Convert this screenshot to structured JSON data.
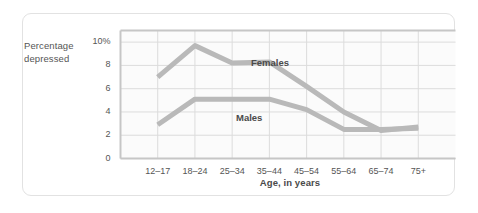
{
  "figure": {
    "y_axis_title_line1": "Percentage",
    "y_axis_title_line2": "depressed",
    "x_axis_title": "Age, in years"
  },
  "colors": {
    "line": "#b9b9b9",
    "grid": "#dcdcdc",
    "axis": "#c6c6c6",
    "text": "#555555",
    "card_border": "#e2e2e2",
    "background": "#ffffff",
    "plot_background": "#fbfbfb"
  },
  "chart_data": {
    "type": "line",
    "title": "",
    "subtitle": "",
    "xlabel": "Age, in years",
    "ylabel": "Percentage depressed",
    "categories": [
      "12–17",
      "18–24",
      "25–34",
      "35–44",
      "45–54",
      "55–64",
      "65–74",
      "75+"
    ],
    "yticks": [
      "0",
      "2",
      "4",
      "6",
      "8",
      "10%"
    ],
    "ytick_values": [
      0,
      2,
      4,
      6,
      8,
      10
    ],
    "ylim": [
      0,
      11
    ],
    "xlim": [
      0,
      9
    ],
    "grid": true,
    "legend": "inline-annotations",
    "series": [
      {
        "name": "Females",
        "values": [
          7.0,
          9.7,
          8.2,
          8.3,
          6.2,
          4.0,
          2.4,
          2.7
        ]
      },
      {
        "name": "Males",
        "values": [
          2.9,
          5.1,
          5.1,
          5.1,
          4.2,
          2.5,
          2.5,
          2.6
        ]
      }
    ],
    "annotations": [
      {
        "text": "Females",
        "x_category": "35–44",
        "y": 9.0
      },
      {
        "text": "Males",
        "x_category": "35–44",
        "y": 4.1
      }
    ]
  }
}
